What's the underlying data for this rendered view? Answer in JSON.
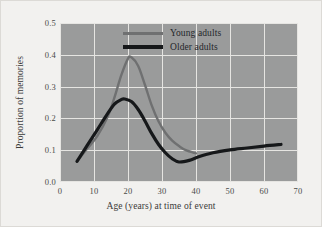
{
  "chart_data": {
    "type": "line",
    "title": "",
    "xlabel": "Age (years) at time of event",
    "ylabel": "Proportion of memories",
    "xlim": [
      0,
      70
    ],
    "ylim": [
      0.0,
      0.5
    ],
    "xticks": [
      "0",
      "10",
      "20",
      "30",
      "40",
      "50",
      "60",
      "70"
    ],
    "xtick_values": [
      0,
      10,
      20,
      30,
      40,
      50,
      60,
      70
    ],
    "yticks": [
      "0.0",
      "0.1",
      "0.2",
      "0.3",
      "0.4",
      "0.5"
    ],
    "ytick_values": [
      0.0,
      0.1,
      0.2,
      0.3,
      0.4,
      0.5
    ],
    "grid": true,
    "legend_position": "upper right",
    "plot_background": "#9a9b9b",
    "series": [
      {
        "name": "Young adults",
        "color": "#6f7071",
        "width": 2.4,
        "x": [
          5,
          8,
          11,
          14,
          16,
          18,
          20,
          21,
          23,
          25,
          27,
          29,
          31,
          33,
          35,
          37,
          40
        ],
        "y": [
          0.065,
          0.105,
          0.145,
          0.205,
          0.265,
          0.335,
          0.388,
          0.392,
          0.365,
          0.305,
          0.24,
          0.19,
          0.155,
          0.13,
          0.113,
          0.1,
          0.09
        ]
      },
      {
        "name": "Older adults",
        "color": "#16181a",
        "width": 3.2,
        "x": [
          5,
          8,
          11,
          14,
          16,
          18,
          19,
          21,
          23,
          25,
          27,
          29,
          31,
          33,
          35,
          38,
          41,
          45,
          50,
          55,
          60,
          65
        ],
        "y": [
          0.065,
          0.115,
          0.165,
          0.215,
          0.245,
          0.259,
          0.261,
          0.253,
          0.228,
          0.192,
          0.152,
          0.118,
          0.092,
          0.073,
          0.063,
          0.068,
          0.08,
          0.092,
          0.101,
          0.107,
          0.113,
          0.118
        ]
      }
    ]
  },
  "legend": {
    "items": [
      {
        "label": "Young adults",
        "swatch": "young"
      },
      {
        "label": "Older adults",
        "swatch": "older"
      }
    ]
  }
}
